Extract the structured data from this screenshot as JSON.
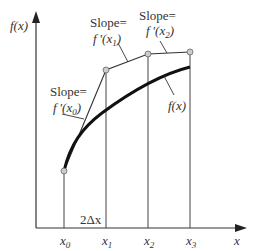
{
  "diagram": {
    "y_axis_label": "f(x)",
    "x_axis_label": "x",
    "curve_label": "f(x)",
    "interval_label": "2Δx",
    "x_ticks": [
      {
        "base": "x",
        "sub": "0"
      },
      {
        "base": "x",
        "sub": "1"
      },
      {
        "base": "x",
        "sub": "2"
      },
      {
        "base": "x",
        "sub": "3"
      }
    ],
    "annotations": [
      {
        "line1": "Slope=",
        "fn": "f ′(x",
        "sub": "0",
        "close": ")"
      },
      {
        "line1": "Slope=",
        "fn": "f ′(x",
        "sub": "1",
        "close": ")"
      },
      {
        "line1": "Slope=",
        "fn": "f ′(x",
        "sub": "2",
        "close": ")"
      }
    ],
    "colors": {
      "axis": "#333333",
      "curve": "#111111",
      "point_fill": "#cccccc"
    }
  }
}
